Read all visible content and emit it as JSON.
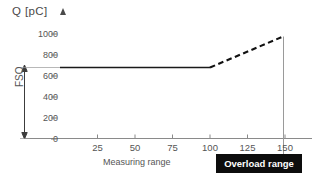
{
  "chart_data": {
    "type": "line",
    "title": "Q [pC]",
    "xlabel": "",
    "ylabel": "Q [pC]",
    "xlim": [
      0,
      157
    ],
    "ylim": [
      0,
      1080
    ],
    "grid": false,
    "legend": null,
    "y_ticks": [
      0,
      200,
      400,
      600,
      800,
      1000
    ],
    "y_tick_labels": [
      "0",
      "200",
      "400",
      "600",
      "800",
      "1000"
    ],
    "x_ticks": [
      25,
      50,
      75,
      100,
      125,
      150
    ],
    "x_tick_labels": [
      "25",
      "50",
      "75",
      "100",
      "125",
      "150"
    ],
    "series": [
      {
        "name": "measuring-range-response",
        "style": "solid",
        "color": "#1a1a1a",
        "points": [
          [
            0,
            700
          ],
          [
            100,
            700
          ]
        ]
      },
      {
        "name": "overload-range-response",
        "style": "dashed",
        "color": "#111111",
        "points": [
          [
            100,
            700
          ],
          [
            142,
            1000
          ]
        ]
      }
    ],
    "annotations": [
      {
        "name": "fso-bracket",
        "label": "FSO",
        "from": [
          0,
          0
        ],
        "to": [
          0,
          700
        ],
        "orientation": "vertical"
      },
      {
        "name": "overload-limit-line",
        "label": "",
        "x": 142,
        "from_y": 0,
        "to_y": 1000,
        "style": "solid-thin"
      },
      {
        "name": "measuring-range-caption",
        "label": "Measuring range",
        "x_center": 57
      },
      {
        "name": "overload-range-caption",
        "label": "Overload range",
        "x_center": 130
      }
    ]
  },
  "labels": {
    "axis_title": "Q [pC]",
    "fso": "FSO",
    "measuring_range": "Measuring range",
    "overload_range": "Overload range"
  },
  "colors": {
    "background": "#ffffff",
    "axis": "#777777",
    "curve": "#1a1a1a",
    "text": "#555555",
    "overload_box_bg": "#0d0d0d",
    "overload_box_text": "#ffffff"
  }
}
